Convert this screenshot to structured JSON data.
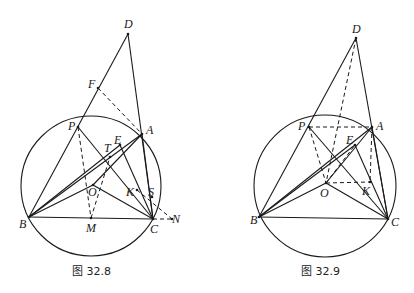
{
  "figures": [
    {
      "id": "fig-32-8",
      "caption": "图 32.8",
      "circle": {
        "cx": 91,
        "cy": 186,
        "r": 70
      },
      "points": {
        "D": {
          "x": 128,
          "y": 34,
          "label": "D",
          "lx": 124,
          "ly": 28
        },
        "F": {
          "x": 98,
          "y": 88,
          "label": "F",
          "lx": 88,
          "ly": 88
        },
        "P": {
          "x": 78,
          "y": 127,
          "label": "P",
          "lx": 68,
          "ly": 130
        },
        "A": {
          "x": 142,
          "y": 134,
          "label": "A",
          "lx": 146,
          "ly": 134
        },
        "E": {
          "x": 120,
          "y": 145,
          "label": "E",
          "lx": 114,
          "ly": 144
        },
        "T": {
          "x": 110,
          "y": 157,
          "label": "T",
          "lx": 104,
          "ly": 152
        },
        "O": {
          "x": 93,
          "y": 185,
          "label": "O",
          "lx": 88,
          "ly": 196
        },
        "K": {
          "x": 137,
          "y": 190,
          "label": "K",
          "lx": 126,
          "ly": 196
        },
        "S": {
          "x": 152,
          "y": 197,
          "label": "S",
          "lx": 148,
          "ly": 196
        },
        "B": {
          "x": 29,
          "y": 217,
          "label": "B",
          "lx": 19,
          "ly": 228
        },
        "M": {
          "x": 91,
          "y": 218,
          "label": "M",
          "lx": 86,
          "ly": 232
        },
        "C": {
          "x": 153,
          "y": 219,
          "label": "C",
          "lx": 150,
          "ly": 233
        },
        "N": {
          "x": 172,
          "y": 219,
          "label": "N",
          "lx": 172,
          "ly": 223
        }
      },
      "solid_segments": [
        [
          "D",
          "B"
        ],
        [
          "D",
          "C"
        ],
        [
          "P",
          "C"
        ],
        [
          "B",
          "A"
        ],
        [
          "B",
          "E"
        ],
        [
          "A",
          "O"
        ],
        [
          "B",
          "O"
        ],
        [
          "O",
          "C"
        ],
        [
          "B",
          "C"
        ],
        [
          "E",
          "C"
        ],
        [
          "A",
          "C"
        ]
      ],
      "dashed_segments": [
        [
          "F",
          "A"
        ],
        [
          "P",
          "M"
        ],
        [
          "M",
          "T"
        ],
        [
          "K",
          "N"
        ],
        [
          "C",
          "N"
        ]
      ],
      "caption_pos": {
        "x": 90,
        "y": 275
      }
    },
    {
      "id": "fig-32-9",
      "caption": "图 32.9",
      "circle": {
        "cx": 325,
        "cy": 186,
        "r": 71
      },
      "points": {
        "D": {
          "x": 356,
          "y": 38,
          "label": "D",
          "lx": 352,
          "ly": 33
        },
        "P": {
          "x": 309,
          "y": 127,
          "label": "P",
          "lx": 298,
          "ly": 130
        },
        "A": {
          "x": 372,
          "y": 127,
          "label": "A",
          "lx": 376,
          "ly": 130
        },
        "E": {
          "x": 355,
          "y": 145,
          "label": "E",
          "lx": 346,
          "ly": 144
        },
        "O": {
          "x": 326,
          "y": 183,
          "label": "O",
          "lx": 320,
          "ly": 197
        },
        "K": {
          "x": 370,
          "y": 182,
          "label": "K",
          "lx": 362,
          "ly": 195
        },
        "B": {
          "x": 259,
          "y": 217,
          "label": "B",
          "lx": 250,
          "ly": 224
        },
        "C": {
          "x": 388,
          "y": 219,
          "label": "C",
          "lx": 391,
          "ly": 226
        }
      },
      "solid_segments": [
        [
          "D",
          "B"
        ],
        [
          "D",
          "C"
        ],
        [
          "P",
          "C"
        ],
        [
          "B",
          "A"
        ],
        [
          "B",
          "E"
        ],
        [
          "E",
          "C"
        ],
        [
          "B",
          "O"
        ],
        [
          "O",
          "C"
        ],
        [
          "B",
          "C"
        ],
        [
          "A",
          "C"
        ],
        [
          "O",
          "A"
        ]
      ],
      "dashed_segments": [
        [
          "P",
          "A"
        ],
        [
          "P",
          "O"
        ],
        [
          "D",
          "O"
        ],
        [
          "O",
          "K"
        ],
        [
          "A",
          "K"
        ],
        [
          "O",
          "E"
        ]
      ],
      "caption_pos": {
        "x": 319,
        "y": 275
      }
    }
  ]
}
